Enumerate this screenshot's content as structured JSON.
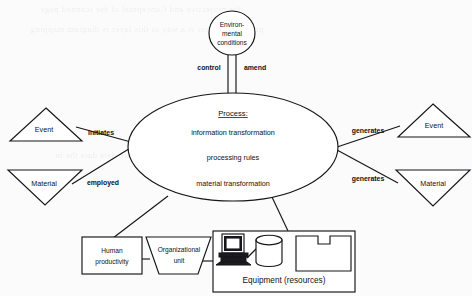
{
  "diagram": {
    "background_color": "#fbfbfb",
    "line_color": "#16161a",
    "nodes": {
      "environment": {
        "shape": "ellipse",
        "line1": "Environ-",
        "line2": "mental",
        "line3": "conditions"
      },
      "process": {
        "shape": "ellipse",
        "title": "Process:",
        "line1": "information transformation",
        "line2": "processing rules",
        "line3": "material transformation"
      },
      "event_in": {
        "shape": "triangle-up",
        "label": "Event"
      },
      "material_in": {
        "shape": "triangle-down",
        "label": "Material"
      },
      "event_out": {
        "shape": "triangle-up",
        "label": "Event"
      },
      "material_out": {
        "shape": "triangle-down",
        "label": "Material"
      },
      "human_productivity": {
        "shape": "rectangle",
        "line1": "Human",
        "line2": "productivity"
      },
      "organizational_unit": {
        "shape": "trapezoid",
        "line1": "Organizational",
        "line2": "unit"
      },
      "equipment": {
        "shape": "rectangle-group",
        "label": "Equipment (resources)",
        "icons": [
          "computer-icon",
          "database-cylinder-icon",
          "machine-notched-icon"
        ]
      }
    },
    "edges": [
      {
        "from": "environment",
        "to": "process",
        "label": "control"
      },
      {
        "from": "environment",
        "to": "process",
        "label": "amend"
      },
      {
        "from": "event_in",
        "to": "process",
        "label": "initiates"
      },
      {
        "from": "material_in",
        "to": "process",
        "label": "employed"
      },
      {
        "from": "process",
        "to": "event_out",
        "label": "generates"
      },
      {
        "from": "process",
        "to": "material_out",
        "label": "generates"
      },
      {
        "from": "process",
        "to": "human_productivity",
        "label": ""
      },
      {
        "from": "process",
        "to": "equipment",
        "label": ""
      },
      {
        "from": "human_productivity",
        "to": "organizational_unit",
        "label": ""
      },
      {
        "from": "organizational_unit",
        "to": "equipment",
        "label": ""
      }
    ]
  },
  "background_bleed": [
    "the projective and Conceptual of the scanned page",
    "progress process is a way to this layer is diagram mapping",
    "more to be used into on the are data data the in"
  ]
}
